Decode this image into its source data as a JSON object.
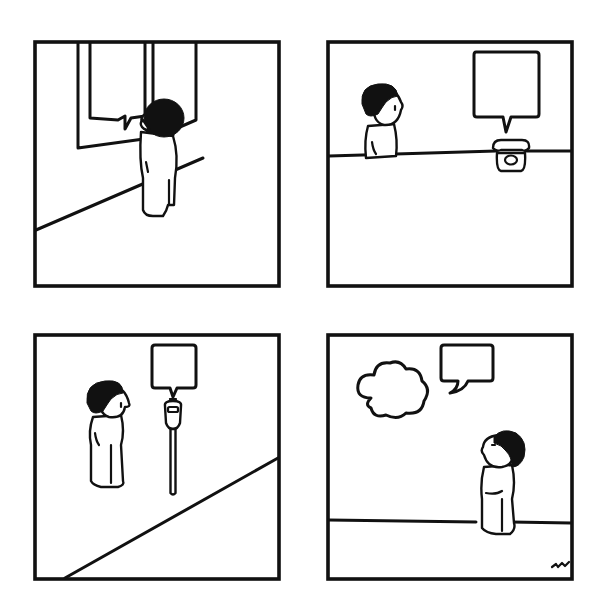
{
  "comic": {
    "panel_count": 4,
    "ink_color": "#111111",
    "background_color": "#ffffff",
    "signature": "artist-signature",
    "panels": [
      {
        "index": 1,
        "description": "Boy standing facing a wall with a tall framed sign; an empty speech bubble hangs inside the sign",
        "speech_bubble_text": ""
      },
      {
        "index": 2,
        "description": "Boy peers over a counter at a rotary telephone; an empty speech bubble rises from the phone",
        "speech_bubble_text": ""
      },
      {
        "index": 3,
        "description": "Boy looks at a parking meter; an empty speech bubble rises from the meter",
        "speech_bubble_text": ""
      },
      {
        "index": 4,
        "description": "Boy looks up at an empty cloud and an empty speech bubble in the sky",
        "speech_bubble_text": "",
        "thought_cloud_text": ""
      }
    ]
  }
}
